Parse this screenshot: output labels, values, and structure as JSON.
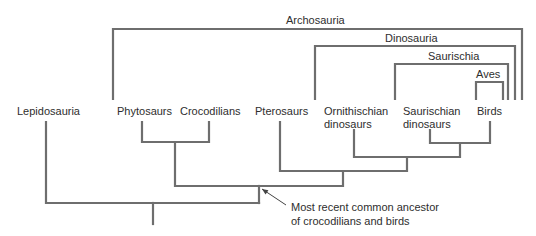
{
  "diagram": {
    "colors": {
      "line": "#6e6e6e",
      "text": "#2e2e2e",
      "background": "#ffffff"
    },
    "taxa": [
      {
        "id": "lepidosauria",
        "lines": [
          "Lepidosauria"
        ],
        "x": 46,
        "label_x": 17,
        "label_y": 115
      },
      {
        "id": "phytosaurs",
        "lines": [
          "Phytosaurs"
        ],
        "x": 142,
        "label_x": 117,
        "label_y": 115
      },
      {
        "id": "crocodilians",
        "lines": [
          "Crocodilians"
        ],
        "x": 209,
        "label_x": 180,
        "label_y": 115
      },
      {
        "id": "pterosaurs",
        "lines": [
          "Pterosaurs"
        ],
        "x": 280,
        "label_x": 255,
        "label_y": 115
      },
      {
        "id": "ornithischian",
        "lines": [
          "Ornithischian",
          "dinosaurs"
        ],
        "x": 354,
        "label_x": 324,
        "label_y": 115
      },
      {
        "id": "saurischian",
        "lines": [
          "Saurischian",
          "dinosaurs"
        ],
        "x": 430,
        "label_x": 403,
        "label_y": 115
      },
      {
        "id": "birds",
        "lines": [
          "Birds"
        ],
        "x": 490,
        "label_x": 477,
        "label_y": 115
      }
    ],
    "clades": [
      {
        "id": "archosauria",
        "name": "Archosauria",
        "left": 113,
        "right": 522,
        "top": 29,
        "bottom": 100,
        "label_x": 286,
        "label_y": 24
      },
      {
        "id": "dinosauria",
        "name": "Dinosauria",
        "left": 315,
        "right": 515,
        "top": 46,
        "bottom": 100,
        "label_x": 385,
        "label_y": 42
      },
      {
        "id": "saurischia",
        "name": "Saurischia",
        "left": 395,
        "right": 508,
        "top": 64,
        "bottom": 100,
        "label_x": 428,
        "label_y": 60
      },
      {
        "id": "aves",
        "name": "Aves",
        "left": 476,
        "right": 503,
        "top": 82,
        "bottom": 100,
        "label_x": 476,
        "label_y": 78
      }
    ],
    "tree_paths": [
      {
        "id": "phytosaur-croc-join",
        "d": "M142 122 V142 H209 V122"
      },
      {
        "id": "croc-line-stem",
        "d": "M175 142 V186 H259"
      },
      {
        "id": "saurischian-birds-join",
        "d": "M430 130 V143 H490 V122"
      },
      {
        "id": "dinosaur-join",
        "d": "M354 130 V157 H460 V143"
      },
      {
        "id": "ornithodira-join",
        "d": "M280 122 V171 H407 V157"
      },
      {
        "id": "archosaur-join",
        "d": "M259 186 H343 V171"
      },
      {
        "id": "archosaur-stem",
        "d": "M259 186 V203"
      },
      {
        "id": "root-join",
        "d": "M46 122 V203 H259"
      },
      {
        "id": "root-stem",
        "d": "M153 203 V224"
      }
    ],
    "annotation": {
      "lines": [
        "Most recent common ancestor",
        "of crocodilians and birds"
      ],
      "text_x": 291,
      "text_y": 211,
      "line_height": 14,
      "arrow_from": [
        286,
        205
      ],
      "arrow_to": [
        262,
        189
      ]
    }
  }
}
